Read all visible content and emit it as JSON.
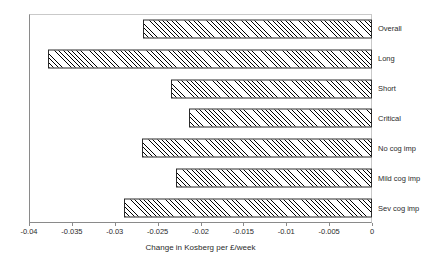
{
  "chart_data": {
    "type": "bar",
    "orientation": "horizontal",
    "title": "",
    "xlabel": "Change in Kosberg per £/week",
    "ylabel": "",
    "xlim": [
      -0.04,
      0
    ],
    "grid": false,
    "legend": null,
    "categories": [
      "Overall",
      "Long",
      "Short",
      "Critical",
      "No cog imp",
      "Mild cog imp",
      "Sev cog imp"
    ],
    "values": [
      -0.0267,
      -0.0378,
      -0.0234,
      -0.0213,
      -0.0268,
      -0.0229,
      -0.0289
    ],
    "xticks": [
      -0.04,
      -0.035,
      -0.03,
      -0.025,
      -0.02,
      -0.015,
      -0.01,
      -0.005,
      0
    ],
    "xticklabels": [
      "-0.04",
      "-0.035",
      "-0.03",
      "-0.025",
      "-0.02",
      "-0.015",
      "-0.01",
      "-0.005",
      "0"
    ],
    "bar_style": {
      "fill": "diagonal-hatch",
      "hatch_color": "#000000",
      "background": "#ffffff",
      "border_color": "#2b2b2b"
    }
  }
}
